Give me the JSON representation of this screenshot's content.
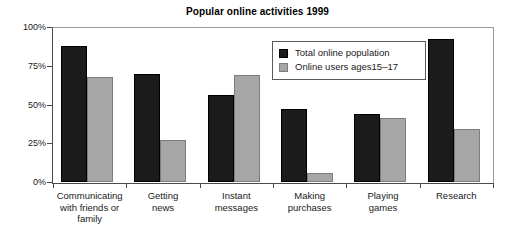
{
  "chart_data": {
    "type": "bar",
    "title": "Popular online activities 1999",
    "xlabel": "",
    "ylabel": "",
    "ylim": [
      0,
      100
    ],
    "yticks": [
      "0%",
      "25%",
      "50%",
      "75%",
      "100%"
    ],
    "ytick_values": [
      0,
      25,
      50,
      75,
      100
    ],
    "grid": false,
    "legend_position": "inside-top-center",
    "categories": [
      "Communicating with friends or family",
      "Getting news",
      "Instant messages",
      "Making purchases",
      "Playing games",
      "Research"
    ],
    "category_lines": [
      [
        "Communicating",
        "with friends or",
        "family"
      ],
      [
        "Getting",
        "news"
      ],
      [
        "Instant",
        "messages"
      ],
      [
        "Making",
        "purchases"
      ],
      [
        "Playing",
        "games"
      ],
      [
        "Research"
      ]
    ],
    "series": [
      {
        "name": "Total online population",
        "color": "#1b1b1b",
        "values": [
          88,
          70,
          56,
          47,
          44,
          92
        ]
      },
      {
        "name": "Online users ages15–17",
        "color": "#a6a6a6",
        "values": [
          68,
          27,
          69,
          6,
          41,
          34
        ]
      }
    ]
  },
  "legend": {
    "entries": [
      {
        "label": "Total online population"
      },
      {
        "label": "Online users ages15–17"
      }
    ]
  }
}
